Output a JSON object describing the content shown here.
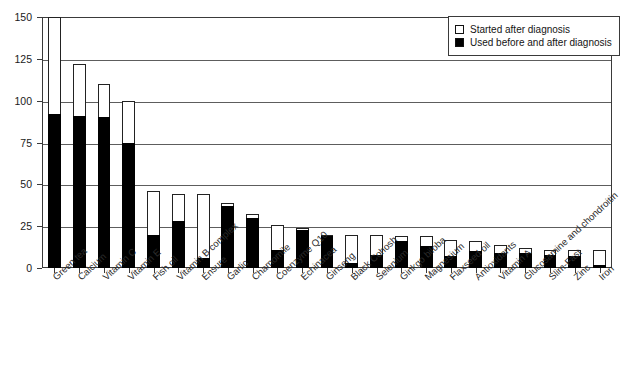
{
  "chart_data": {
    "type": "bar",
    "title": "",
    "subtitle": "",
    "xlabel": "",
    "ylabel": "",
    "ylim": [
      0,
      150
    ],
    "ytick_labels": [
      "0",
      "25",
      "50",
      "75",
      "100",
      "125",
      "150"
    ],
    "ytick_values": [
      0,
      25,
      50,
      75,
      100,
      125,
      150
    ],
    "grid": true,
    "stacked": true,
    "legend_position": "top-right",
    "categories": [
      "Green tea",
      "Calcium",
      "Vitamin C",
      "Vitamin E",
      "Fish oil",
      "Vitamin B complex",
      "Ensure",
      "Garlic",
      "Chamomile",
      "Coenzyme Q10",
      "Echinacea",
      "Ginseng",
      "Black Cohosh",
      "Selenium",
      "Ginkgo biloba",
      "Magnesium",
      "Flaxseed oil",
      "Antioxidants",
      "Vitamin A",
      "Glucosamine and chondroitin",
      "Slim-Fast",
      "Zinc",
      "Iron"
    ],
    "series": [
      {
        "name": "Used before and after diagnosis",
        "color": "#000000",
        "values": [
          92,
          91,
          90,
          75,
          20,
          28,
          6,
          37,
          30,
          11,
          23,
          19,
          3,
          8,
          16,
          13,
          7,
          10,
          9,
          9,
          8,
          7,
          2
        ]
      },
      {
        "name": "Started after diagnosis",
        "color": "#ffffff",
        "values": [
          58,
          31,
          20,
          25,
          26,
          16,
          38,
          2,
          2,
          15,
          1,
          1,
          17,
          12,
          3,
          6,
          10,
          6,
          5,
          3,
          3,
          4,
          9
        ]
      }
    ],
    "totals": [
      150,
      122,
      110,
      100,
      46,
      44,
      44,
      39,
      32,
      26,
      24,
      20,
      20,
      20,
      19,
      19,
      17,
      16,
      14,
      12,
      11,
      11,
      11
    ]
  },
  "legend": {
    "items": [
      {
        "label": "Started after diagnosis",
        "swatch": "open-square"
      },
      {
        "label": "Used before and after diagnosis",
        "swatch": "filled-square"
      }
    ]
  }
}
